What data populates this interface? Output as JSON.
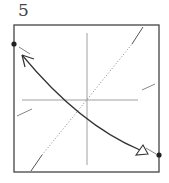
{
  "step_number": "5",
  "diagram": {
    "type": "origami-fold-step",
    "paper": "square",
    "elements": [
      "vertical-crease",
      "horizontal-crease",
      "valley-fold-diagonal",
      "fold-arrow",
      "reference-dots",
      "pinch-marks"
    ],
    "colors": {
      "line": "#333333",
      "crease": "#777777"
    }
  }
}
